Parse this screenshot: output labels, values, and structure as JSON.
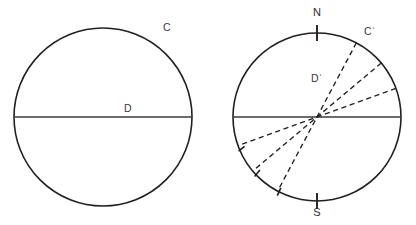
{
  "figure": {
    "background_color": "#ffffff",
    "stroke_color": "#231f20",
    "diameter_color": "#3b3b3d",
    "label_color": "#3a3a3c"
  },
  "left_diagram": {
    "name": "plain-circle",
    "center": {
      "x": 103,
      "y": 117
    },
    "radius": 89,
    "labels": {
      "arc_label": "C",
      "arc_label_x": 163,
      "arc_label_y": 31,
      "diameter_label": "D",
      "diameter_label_x": 124,
      "diameter_label_y": 112
    },
    "diameter": {
      "orientation": "horizontal",
      "y": 117,
      "x_start": 14,
      "x_end": 192
    }
  },
  "right_diagram": {
    "name": "compass-circle",
    "center": {
      "x": 317,
      "y": 117
    },
    "radius": 84,
    "labels": {
      "north": "N",
      "north_x": 317,
      "north_y": 16,
      "south": "S",
      "south_x": 317,
      "south_y": 216,
      "arc_label": "Cˈ",
      "arc_label_x": 364,
      "arc_label_y": 35,
      "interior_label": "Dˈ",
      "interior_label_x": 311,
      "interior_label_y": 82
    },
    "diameter": {
      "orientation": "horizontal",
      "y": 117,
      "x_start": 233,
      "x_end": 401
    },
    "compass_ticks": [
      {
        "name": "north-tick",
        "x1": 317,
        "y1": 25,
        "x2": 317,
        "y2": 41
      },
      {
        "name": "south-tick",
        "x1": 317,
        "y1": 193,
        "x2": 317,
        "y2": 209
      }
    ],
    "dashed_lines": [
      {
        "name": "dashed-line-steep",
        "angle_deg": 62,
        "label": "steepest radial line"
      },
      {
        "name": "dashed-line-middle",
        "angle_deg": 40,
        "label": "middle radial line"
      },
      {
        "name": "dashed-line-shallow",
        "angle_deg": 20,
        "label": "shallowest radial line"
      }
    ],
    "arc_ticks": [
      {
        "name": "arc-tick-lower-left-shallow",
        "angle_deg": 200
      },
      {
        "name": "arc-tick-lower-left-middle",
        "angle_deg": 220
      },
      {
        "name": "arc-tick-lower-left-steep",
        "angle_deg": 242
      }
    ]
  }
}
